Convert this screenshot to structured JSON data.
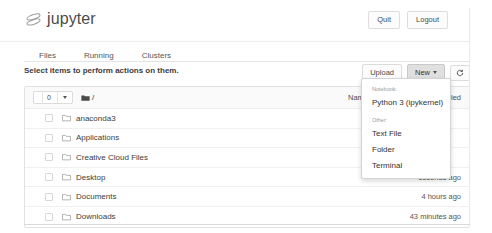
{
  "header": {
    "logo_text": "jupyter",
    "logo_icon": "jupyter-planet-icon",
    "quit_label": "Quit",
    "logout_label": "Logout"
  },
  "tabs": [
    {
      "label": "Files",
      "name": "tab-files"
    },
    {
      "label": "Running",
      "name": "tab-running"
    },
    {
      "label": "Clusters",
      "name": "tab-clusters"
    }
  ],
  "actionbar": {
    "hint": "Select items to perform actions on them.",
    "upload_label": "Upload",
    "new_label": "New",
    "refresh_icon": "refresh-icon"
  },
  "filelist": {
    "selected_count": "0",
    "breadcrumb_root": "/",
    "breadcrumb_icon": "folder-filled-icon",
    "col_name": "Name",
    "col_name_sort": "sort-descending-icon",
    "col_modified": "Last Modified",
    "rows": [
      {
        "name": "anaconda3",
        "modified": "",
        "icon": "folder-icon"
      },
      {
        "name": "Applications",
        "modified": "",
        "icon": "folder-icon"
      },
      {
        "name": "Creative Cloud Files",
        "modified": "",
        "icon": "folder-icon"
      },
      {
        "name": "Desktop",
        "modified": "seconds ago",
        "icon": "folder-icon"
      },
      {
        "name": "Documents",
        "modified": "4 hours ago",
        "icon": "folder-icon"
      },
      {
        "name": "Downloads",
        "modified": "43 minutes ago",
        "icon": "folder-icon"
      }
    ]
  },
  "new_menu": {
    "notebook_header": "Notebook:",
    "notebook_items": [
      "Python 3 (ipykernel)"
    ],
    "other_header": "Other:",
    "other_items": [
      "Text File",
      "Folder",
      "Terminal"
    ]
  },
  "colors": {
    "logo_text": "#4c4c4c",
    "border": "#e2e2e2",
    "active_button_bg": "#e0e0e0"
  }
}
